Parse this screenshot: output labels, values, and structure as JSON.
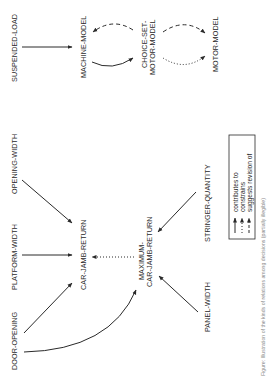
{
  "diagram": {
    "orientation": "rotated-90-ccw",
    "nodes": {
      "suspended_load": "SUSPENDED-LOAD",
      "machine_model": "MACHINE-MODEL",
      "choice_set_line1": "CHOICE-SET-",
      "choice_set_line2": "MOTOR-MODEL",
      "motor_model": "MOTOR-MODEL",
      "opening_width": "OPENING-WIDTH",
      "platform_width": "PLATFORM-WIDTH",
      "door_opening": "DOOR-OPENING",
      "car_jamb_return": "CAR-JAMB-RETURN",
      "max_line1": "MAXIMUM-",
      "max_line2": "CAR-JAMB-RETURN",
      "panel_width": "PANEL-WIDTH",
      "stringer_quantity": "STRINGER-QUANTITY"
    },
    "edges": [
      {
        "from": "SUSPENDED-LOAD",
        "to": "MACHINE-MODEL",
        "type": "contributes to"
      },
      {
        "from": "MACHINE-MODEL",
        "to": "CHOICE-SET-MOTOR-MODEL",
        "type": "contributes to"
      },
      {
        "from": "CHOICE-SET-MOTOR-MODEL",
        "to": "MACHINE-MODEL",
        "type": "suggests revision of"
      },
      {
        "from": "CHOICE-SET-MOTOR-MODEL",
        "to": "MOTOR-MODEL",
        "type": "suggests revision of"
      },
      {
        "from": "MOTOR-MODEL",
        "to": "CHOICE-SET-MOTOR-MODEL",
        "type": "constrains"
      },
      {
        "from": "OPENING-WIDTH",
        "to": "CAR-JAMB-RETURN",
        "type": "contributes to"
      },
      {
        "from": "PLATFORM-WIDTH",
        "to": "CAR-JAMB-RETURN",
        "type": "contributes to"
      },
      {
        "from": "DOOR-OPENING",
        "to": "CAR-JAMB-RETURN",
        "type": "contributes to"
      },
      {
        "from": "DOOR-OPENING",
        "to": "MAXIMUM-CAR-JAMB-RETURN",
        "type": "contributes to"
      },
      {
        "from": "MAXIMUM-CAR-JAMB-RETURN",
        "to": "CAR-JAMB-RETURN",
        "type": "constrains"
      },
      {
        "from": "PANEL-WIDTH",
        "to": "MAXIMUM-CAR-JAMB-RETURN",
        "type": "contributes to"
      },
      {
        "from": "STRINGER-QUANTITY",
        "to": "MAXIMUM-CAR-JAMB-RETURN",
        "type": "contributes to"
      }
    ],
    "legend": {
      "contributes": "contributes to",
      "constrains": "constrains",
      "suggests": "suggests revision of"
    },
    "caption": "Figure: Illustration of the kinds of relations among decisions (partially illegible)"
  }
}
